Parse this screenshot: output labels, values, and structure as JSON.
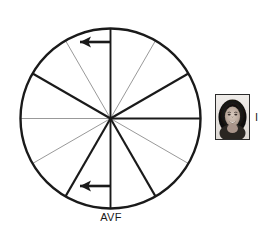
{
  "figure": {
    "name": "hexaxial-reference-wheel",
    "background_color": "#ffffff",
    "center": {
      "x": 110.5,
      "y": 118.5
    },
    "radius": 90,
    "circle": {
      "stroke_color": "#1a1a1a",
      "stroke_width": 2.4
    },
    "spoke_count": 12,
    "spoke_interval_degrees": 30,
    "colors": {
      "thick_spoke": "#1a1a1a",
      "thin_spoke": "#8d8d8d",
      "arrow": "#1a1a1a",
      "text": "#1a1a1a"
    },
    "spokes": [
      {
        "angle_deg": 0,
        "weight": "thick",
        "color": "#1a1a1a",
        "width": 1.9
      },
      {
        "angle_deg": 30,
        "weight": "thick",
        "color": "#1a1a1a",
        "width": 2.1
      },
      {
        "angle_deg": 60,
        "weight": "thin",
        "color": "#8d8d8d",
        "width": 0.9
      },
      {
        "angle_deg": 90,
        "weight": "thick",
        "color": "#1a1a1a",
        "width": 1.9
      },
      {
        "angle_deg": 120,
        "weight": "thin",
        "color": "#8d8d8d",
        "width": 0.9
      },
      {
        "angle_deg": 150,
        "weight": "thick",
        "color": "#1a1a1a",
        "width": 2.1
      },
      {
        "angle_deg": 180,
        "weight": "thin",
        "color": "#8d8d8d",
        "width": 0.9
      },
      {
        "angle_deg": 210,
        "weight": "thin",
        "color": "#8d8d8d",
        "width": 0.9
      },
      {
        "angle_deg": 240,
        "weight": "thick",
        "color": "#1a1a1a",
        "width": 2.1
      },
      {
        "angle_deg": 270,
        "weight": "thick",
        "color": "#1a1a1a",
        "width": 1.9
      },
      {
        "angle_deg": 300,
        "weight": "thick",
        "color": "#1a1a1a",
        "width": 2.1
      },
      {
        "angle_deg": 330,
        "weight": "thin",
        "color": "#8d8d8d",
        "width": 0.9
      }
    ],
    "arrows": [
      {
        "name": "upper-left-arrow",
        "direction": "left",
        "tail": {
          "x": 110.5,
          "y": 42
        },
        "head": {
          "x": 74,
          "y": 42
        },
        "shaft_width": 2.6
      },
      {
        "name": "lower-left-arrow",
        "direction": "left",
        "tail": {
          "x": 110.5,
          "y": 186
        },
        "head": {
          "x": 74,
          "y": 186
        },
        "shaft_width": 2.6
      }
    ],
    "labels": {
      "bottom_axis": "AVF",
      "right_axis": "I"
    },
    "portrait": {
      "name": "patient-portrait",
      "description": "grayscale portrait photograph of a smiling woman with dark hair",
      "border_color": "#2b2b2b",
      "x": 215,
      "y": 94,
      "width": 33,
      "height": 44
    }
  }
}
